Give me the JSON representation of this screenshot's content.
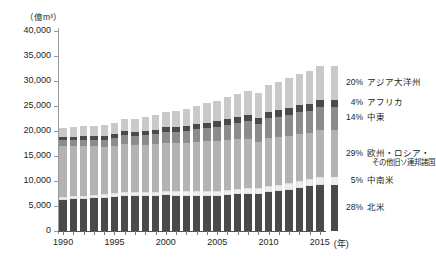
{
  "chart_data": {
    "type": "bar",
    "subtype": "stacked-bar",
    "title": "",
    "xlabel": "年",
    "ylabel": "億m³",
    "y_unit_label": "（億m³）",
    "x_unit_label": "(年)",
    "ylim": [
      0,
      40000
    ],
    "ytick_labels": [
      "0",
      "5,000",
      "10,000",
      "15,000",
      "20,000",
      "25,000",
      "30,000",
      "35,000",
      "40,000"
    ],
    "ytick_values": [
      0,
      5000,
      10000,
      15000,
      20000,
      25000,
      30000,
      35000,
      40000
    ],
    "xtick_labels": [
      "1990",
      "1995",
      "2000",
      "2005",
      "2010",
      "2015"
    ],
    "xtick_values": [
      1990,
      1995,
      2000,
      2005,
      2010,
      2015
    ],
    "grid": false,
    "legend_position": "right",
    "categories": [
      1990,
      1991,
      1992,
      1993,
      1994,
      1995,
      1996,
      1997,
      1998,
      1999,
      2000,
      2001,
      2002,
      2003,
      2004,
      2005,
      2006,
      2007,
      2008,
      2009,
      2010,
      2011,
      2012,
      2013,
      2014,
      2015
    ],
    "series": [
      {
        "name": "北米",
        "percent_label": "28%",
        "color": "#4a4a4a",
        "order": 0,
        "values": [
          6300,
          6350,
          6500,
          6600,
          6700,
          6850,
          7050,
          7000,
          7000,
          7000,
          7150,
          7100,
          7100,
          7050,
          7100,
          7050,
          7150,
          7400,
          7450,
          7400,
          7800,
          8000,
          8300,
          8600,
          9000,
          9300
        ]
      },
      {
        "name": "中南米",
        "percent_label": "5%",
        "color": "#eeeeee",
        "order": 1,
        "values": [
          560,
          580,
          600,
          620,
          640,
          680,
          720,
          740,
          760,
          780,
          820,
          840,
          860,
          880,
          920,
          960,
          1000,
          1050,
          1100,
          1120,
          1200,
          1250,
          1300,
          1350,
          1420,
          1500
        ]
      },
      {
        "name": "欧州・ロシア・その他旧ソ連邦諸国",
        "percent_label": "29%",
        "color": "#b3b3b3",
        "order": 2,
        "values": [
          10200,
          10100,
          9900,
          9700,
          9500,
          9500,
          9700,
          9500,
          9500,
          9600,
          9700,
          9700,
          9600,
          9900,
          9900,
          9900,
          10000,
          9900,
          9900,
          9200,
          9700,
          9500,
          9400,
          9500,
          9100,
          9400
        ]
      },
      {
        "name": "中東",
        "percent_label": "14%",
        "color": "#8c8c8c",
        "order": 3,
        "values": [
          1100,
          1200,
          1250,
          1350,
          1450,
          1550,
          1700,
          1800,
          1900,
          2000,
          2150,
          2250,
          2400,
          2550,
          2700,
          2900,
          3100,
          3300,
          3500,
          3650,
          3900,
          4100,
          4300,
          4400,
          4550,
          4700
        ]
      },
      {
        "name": "アフリカ",
        "percent_label": "4%",
        "color": "#4a4a4a",
        "order": 4,
        "values": [
          650,
          680,
          700,
          720,
          750,
          780,
          820,
          850,
          880,
          900,
          950,
          980,
          1000,
          1050,
          1080,
          1120,
          1150,
          1180,
          1220,
          1200,
          1250,
          1280,
          1300,
          1320,
          1350,
          1400
        ]
      },
      {
        "name": "アジア大洋州",
        "percent_label": "20%",
        "color": "#c9c9c9",
        "order": 5,
        "values": [
          1800,
          1900,
          2000,
          2100,
          2200,
          2350,
          2500,
          2600,
          2700,
          2850,
          3050,
          3200,
          3400,
          3600,
          3850,
          4100,
          4350,
          4600,
          4850,
          5000,
          5400,
          5700,
          6000,
          6300,
          6500,
          6700
        ]
      }
    ]
  },
  "legend": {
    "entries": [
      {
        "percent": "20%",
        "name": "アジア大洋州",
        "sub": ""
      },
      {
        "percent": "4%",
        "name": "アフリカ",
        "sub": ""
      },
      {
        "percent": "14%",
        "name": "中東",
        "sub": ""
      },
      {
        "percent": "29%",
        "name": "欧州・ロシア・",
        "sub": "その他旧ソ連邦諸国"
      },
      {
        "percent": "5%",
        "name": "中南米",
        "sub": ""
      },
      {
        "percent": "28%",
        "name": "北米",
        "sub": ""
      }
    ]
  }
}
